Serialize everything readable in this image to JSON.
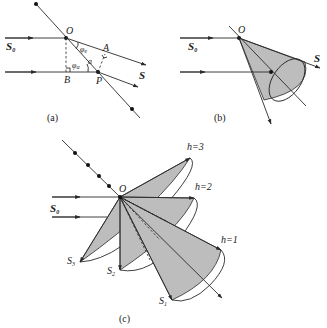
{
  "panels": {
    "a": {
      "caption": "(a)",
      "labels": {
        "O": "O",
        "A": "A",
        "B": "B",
        "P": "P",
        "S": "S",
        "S0_base": "S",
        "S0_sub": "0",
        "phi_top": "φ",
        "phi_top_sub": "e",
        "phi_bottom": "φ",
        "phi_bottom_sub": "α",
        "a": "a"
      }
    },
    "b": {
      "caption": "(b)",
      "labels": {
        "O": "O",
        "S": "S",
        "S0_base": "S",
        "S0_sub": "0"
      }
    },
    "c": {
      "caption": "(c)",
      "labels": {
        "O": "O",
        "S0_base": "S",
        "S0_sub": "0",
        "h3": "h=3",
        "h2": "h=2",
        "h1": "h=1",
        "S3_base": "S",
        "S3_sub": "3",
        "S2_base": "S",
        "S2_sub": "2",
        "S1_base": "S",
        "S1_sub": "1"
      }
    }
  },
  "colors": {
    "line": "#2a2a2a",
    "cone_fill": "#bdbdbd",
    "background": "#ffffff"
  }
}
